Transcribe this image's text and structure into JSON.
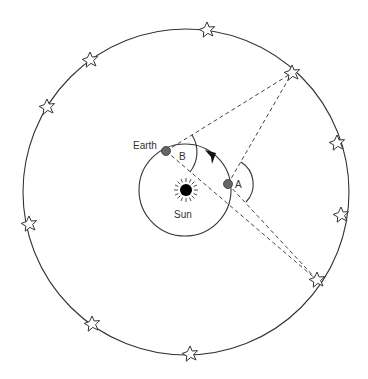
{
  "diagram": {
    "type": "stellar-parallax",
    "labels": {
      "earth": "Earth",
      "sun": "Sun",
      "angle_a": "A",
      "angle_b": "B"
    },
    "celestial_sphere": {
      "cx": 186,
      "cy": 192,
      "r": 163
    },
    "earth_orbit": {
      "cx": 185,
      "cy": 190,
      "r": 46,
      "direction": "counter-clockwise"
    },
    "sun": {
      "x": 186,
      "y": 190
    },
    "earth_positions": [
      {
        "name": "Earth",
        "x": 166,
        "y": 151,
        "angle_label": "B"
      },
      {
        "name": "Earth (later)",
        "x": 228,
        "y": 184,
        "angle_label": "A"
      }
    ],
    "target_stars": [
      {
        "x": 292,
        "y": 73
      },
      {
        "x": 317,
        "y": 280
      }
    ],
    "stars": [
      {
        "x": 207,
        "y": 30
      },
      {
        "x": 292,
        "y": 73
      },
      {
        "x": 337,
        "y": 143
      },
      {
        "x": 341,
        "y": 215
      },
      {
        "x": 317,
        "y": 280
      },
      {
        "x": 190,
        "y": 354
      },
      {
        "x": 92,
        "y": 324
      },
      {
        "x": 29,
        "y": 224
      },
      {
        "x": 47,
        "y": 107
      },
      {
        "x": 90,
        "y": 60
      }
    ],
    "colors": {
      "line": "#333333",
      "planet": "#666666",
      "sun": "#000000",
      "background": "#ffffff"
    }
  }
}
